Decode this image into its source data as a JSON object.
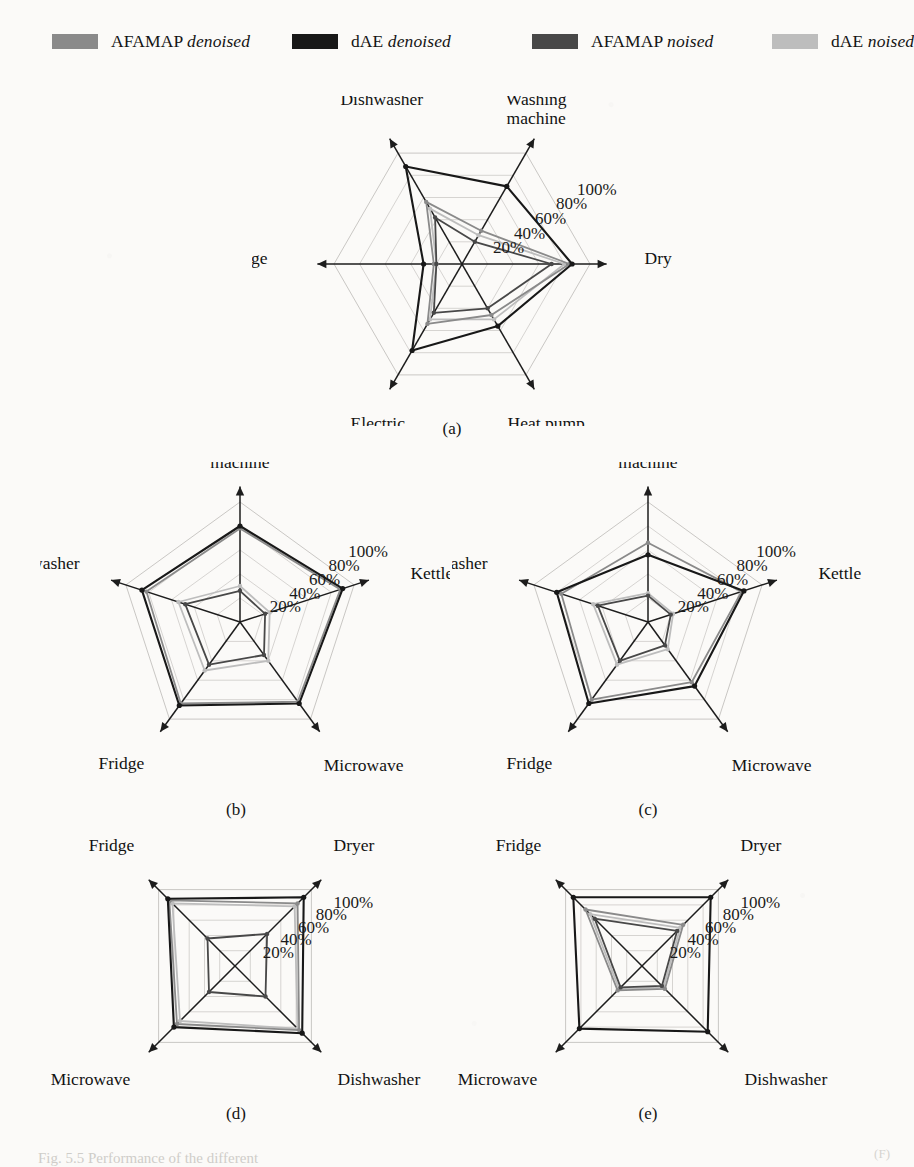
{
  "figure": {
    "caption_partial": "Fig. 5.5  Performance of the different",
    "page_mark": "(F)"
  },
  "legend": {
    "items": [
      {
        "label_main": "AFAMAP",
        "label_em": "denoised",
        "color": "#8a8a8a",
        "swatch_name": "legend-swatch-afamap-denoised"
      },
      {
        "label_main": "dAE",
        "label_em": "denoised",
        "color": "#181818",
        "swatch_name": "legend-swatch-dae-denoised"
      },
      {
        "label_main": "AFAMAP",
        "label_em": "noised",
        "color": "#484848",
        "swatch_name": "legend-swatch-afamap-noised"
      },
      {
        "label_main": "dAE",
        "label_em": "noised",
        "color": "#bdbdbd",
        "swatch_name": "legend-swatch-dae-noised"
      }
    ]
  },
  "scale": {
    "ticks": [
      "20%",
      "40%",
      "60%",
      "80%",
      "100%"
    ],
    "values": [
      20,
      40,
      60,
      80,
      100
    ],
    "max": 100
  },
  "subcaptions": {
    "a": "(a)",
    "b": "(b)",
    "c": "(c)",
    "d": "(d)",
    "e": "(e)"
  },
  "chart_data": [
    {
      "id": "a",
      "type": "radar",
      "title": "(a)",
      "axes": [
        "Washing machine",
        "Dryer",
        "Heat pump",
        "Electric oven",
        "Fridge",
        "Dishwasher"
      ],
      "rlim": [
        0,
        100
      ],
      "rticks": [
        20,
        40,
        60,
        80,
        100
      ],
      "rtick_labels": [
        "20%",
        "40%",
        "60%",
        "80%",
        "100%"
      ],
      "grid": true,
      "legend_position": "top",
      "series": [
        {
          "name": "AFAMAP denoised",
          "color": "#8a8a8a",
          "values": [
            30,
            84,
            46,
            54,
            22,
            56
          ]
        },
        {
          "name": "dAE denoised",
          "color": "#181818",
          "values": [
            70,
            86,
            56,
            78,
            30,
            88
          ]
        },
        {
          "name": "AFAMAP noised",
          "color": "#484848",
          "values": [
            20,
            70,
            40,
            44,
            20,
            42
          ]
        },
        {
          "name": "dAE noised",
          "color": "#bdbdbd",
          "values": [
            26,
            80,
            50,
            50,
            20,
            50
          ]
        }
      ]
    },
    {
      "id": "b",
      "type": "radar",
      "title": "(b)",
      "axes": [
        "Washing machine",
        "Kettle",
        "Microwave",
        "Fridge",
        "Dishwasher"
      ],
      "rlim": [
        0,
        100
      ],
      "rticks": [
        20,
        40,
        60,
        80,
        100
      ],
      "rtick_labels": [
        "20%",
        "40%",
        "60%",
        "80%",
        "100%"
      ],
      "grid": true,
      "legend_position": "top",
      "series": [
        {
          "name": "AFAMAP denoised",
          "color": "#8a8a8a",
          "values": [
            78,
            88,
            82,
            84,
            82
          ]
        },
        {
          "name": "dAE denoised",
          "color": "#181818",
          "values": [
            80,
            90,
            84,
            86,
            86
          ]
        },
        {
          "name": "AFAMAP noised",
          "color": "#484848",
          "values": [
            26,
            22,
            34,
            44,
            48
          ]
        },
        {
          "name": "dAE noised",
          "color": "#bdbdbd",
          "values": [
            30,
            26,
            40,
            50,
            54
          ]
        }
      ]
    },
    {
      "id": "c",
      "type": "radar",
      "title": "(c)",
      "axes": [
        "Washing machine",
        "Kettle",
        "Microwave",
        "Fridge",
        "Dishwasher"
      ],
      "rlim": [
        0,
        100
      ],
      "rticks": [
        20,
        40,
        60,
        80,
        100
      ],
      "rtick_labels": [
        "20%",
        "40%",
        "60%",
        "80%",
        "100%"
      ],
      "grid": true,
      "legend_position": "top",
      "series": [
        {
          "name": "AFAMAP denoised",
          "color": "#8a8a8a",
          "values": [
            66,
            82,
            62,
            80,
            76
          ]
        },
        {
          "name": "dAE denoised",
          "color": "#181818",
          "values": [
            56,
            84,
            66,
            84,
            80
          ]
        },
        {
          "name": "AFAMAP noised",
          "color": "#484848",
          "values": [
            22,
            20,
            24,
            40,
            44
          ]
        },
        {
          "name": "dAE noised",
          "color": "#bdbdbd",
          "values": [
            24,
            22,
            28,
            44,
            48
          ]
        }
      ]
    },
    {
      "id": "d",
      "type": "radar",
      "title": "(d)",
      "axes": [
        "Dryer",
        "Dishwasher",
        "Microwave",
        "Fridge"
      ],
      "rlim": [
        0,
        100
      ],
      "rticks": [
        20,
        40,
        60,
        80,
        100
      ],
      "rtick_labels": [
        "20%",
        "40%",
        "60%",
        "80%",
        "100%"
      ],
      "grid": true,
      "legend_position": "top",
      "series": [
        {
          "name": "AFAMAP denoised",
          "color": "#8a8a8a",
          "values": [
            82,
            84,
            76,
            86
          ]
        },
        {
          "name": "dAE denoised",
          "color": "#181818",
          "values": [
            90,
            88,
            80,
            88
          ]
        },
        {
          "name": "AFAMAP noised",
          "color": "#484848",
          "values": [
            42,
            40,
            34,
            36
          ]
        },
        {
          "name": "dAE noised",
          "color": "#bdbdbd",
          "values": [
            78,
            82,
            72,
            82
          ]
        }
      ]
    },
    {
      "id": "e",
      "type": "radar",
      "title": "(e)",
      "axes": [
        "Dryer",
        "Dishwasher",
        "Microwave",
        "Fridge"
      ],
      "rlim": [
        0,
        100
      ],
      "rticks": [
        20,
        40,
        60,
        80,
        100
      ],
      "rtick_labels": [
        "20%",
        "40%",
        "60%",
        "80%",
        "100%"
      ],
      "grid": true,
      "legend_position": "top",
      "series": [
        {
          "name": "AFAMAP denoised",
          "color": "#8a8a8a",
          "values": [
            54,
            30,
            32,
            74
          ]
        },
        {
          "name": "dAE denoised",
          "color": "#181818",
          "values": [
            90,
            86,
            82,
            90
          ]
        },
        {
          "name": "AFAMAP noised",
          "color": "#484848",
          "values": [
            46,
            26,
            28,
            62
          ]
        },
        {
          "name": "dAE noised",
          "color": "#bdbdbd",
          "values": [
            50,
            28,
            30,
            68
          ]
        }
      ]
    }
  ],
  "layout": {
    "charts": [
      {
        "id": "a",
        "left": 252,
        "top": 96,
        "w": 420,
        "h": 330,
        "cx": 210,
        "cy": 168,
        "r": 128,
        "start_angle": -60,
        "label_offsets": [
          [
            0,
            -30
          ],
          [
            34,
            0
          ],
          [
            10,
            36
          ],
          [
            -10,
            36
          ],
          [
            -46,
            0
          ],
          [
            -6,
            -30
          ]
        ],
        "tick_anchor": "upper-right",
        "cap_left": 412,
        "cap_top": 419
      },
      {
        "id": "b",
        "left": 40,
        "top": 462,
        "w": 410,
        "h": 330,
        "cx": 200,
        "cy": 160,
        "r": 120,
        "start_angle": -90,
        "label_offsets": [
          [
            0,
            -34
          ],
          [
            38,
            0
          ],
          [
            2,
            36
          ],
          [
            -14,
            34
          ],
          [
            -28,
            -10
          ]
        ],
        "tick_anchor": "upper-right",
        "cap_left": 196,
        "cap_top": 800
      },
      {
        "id": "c",
        "left": 452,
        "top": 462,
        "w": 410,
        "h": 330,
        "cx": 196,
        "cy": 160,
        "r": 120,
        "start_angle": -90,
        "label_offsets": [
          [
            0,
            -34
          ],
          [
            38,
            0
          ],
          [
            2,
            36
          ],
          [
            -14,
            34
          ],
          [
            -28,
            -10
          ]
        ],
        "tick_anchor": "upper-right",
        "cap_left": 608,
        "cap_top": 800
      },
      {
        "id": "d",
        "left": 40,
        "top": 818,
        "w": 410,
        "h": 300,
        "cx": 195,
        "cy": 148,
        "r": 108,
        "start_angle": -45,
        "label_offsets": [
          [
            10,
            -26
          ],
          [
            14,
            30
          ],
          [
            -16,
            30
          ],
          [
            -12,
            -26
          ]
        ],
        "tick_anchor": "upper-right",
        "cap_left": 196,
        "cap_top": 1104
      },
      {
        "id": "e",
        "left": 452,
        "top": 818,
        "w": 410,
        "h": 300,
        "cx": 190,
        "cy": 148,
        "r": 108,
        "start_angle": -45,
        "label_offsets": [
          [
            10,
            -26
          ],
          [
            14,
            30
          ],
          [
            -16,
            30
          ],
          [
            -12,
            -26
          ]
        ],
        "tick_anchor": "upper-right",
        "cap_left": 608,
        "cap_top": 1104
      }
    ]
  }
}
